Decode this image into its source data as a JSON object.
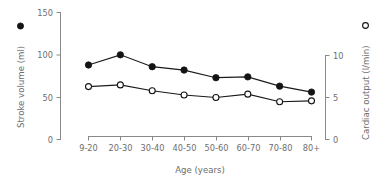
{
  "chart_data": {
    "type": "line",
    "title": "",
    "subtitle": "",
    "xlabel": "Age (years)",
    "ylabel": "Stroke volume (ml)",
    "y2label": "Cardiac output (l/min)",
    "categories": [
      "9-20",
      "20-30",
      "30-40",
      "40-50",
      "50-60",
      "60-70",
      "70-80",
      "80+"
    ],
    "series": [
      {
        "name": "Stroke volume (ml)",
        "marker": "filled-circle",
        "axis": "left",
        "values": [
          88,
          100,
          86,
          82,
          73,
          74,
          63,
          56
        ]
      },
      {
        "name": "Cardiac output (l/min)",
        "marker": "open-circle",
        "axis": "right",
        "values": [
          6.3,
          6.5,
          5.8,
          5.3,
          5.0,
          5.4,
          4.5,
          4.6
        ]
      }
    ],
    "ylim": [
      0,
      150
    ],
    "yticks": [
      0,
      50,
      100,
      150
    ],
    "ytick_labels": [
      "0",
      "50",
      "100",
      "150"
    ],
    "y2lim": [
      0,
      10
    ],
    "y2ticks": [
      0,
      5,
      10
    ],
    "y2tick_labels": [
      "0",
      "5",
      "10"
    ],
    "grid": false,
    "legend_position": "axis-labels",
    "legend": [
      {
        "label": "Stroke volume (ml)",
        "marker": "filled-circle"
      },
      {
        "label": "Cardiac output (l/min)",
        "marker": "open-circle"
      }
    ],
    "colors": {
      "series_line": "#1a1a1a",
      "marker_fill_filled": "#141414",
      "marker_fill_open": "#ffffff",
      "axis": "#8a8a8a",
      "text": "#6d6d6d",
      "background": "#ffffff"
    }
  }
}
